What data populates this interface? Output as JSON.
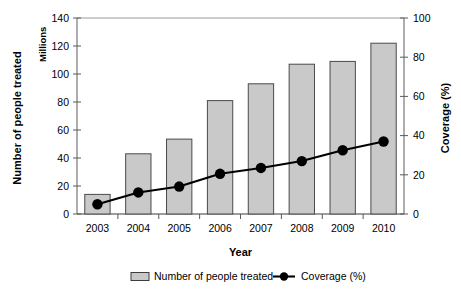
{
  "chart_data": {
    "type": "bar",
    "title": "",
    "categories": [
      "2003",
      "2004",
      "2005",
      "2006",
      "2007",
      "2008",
      "2009",
      "2010"
    ],
    "xlabel": "Year",
    "ylabel": "Number of people treated",
    "y_unit_label": "Millions",
    "ylabel_right": "Coverage (%)",
    "ylim": [
      0,
      140
    ],
    "ylim_right": [
      0,
      100
    ],
    "yticks": [
      0,
      20,
      40,
      60,
      80,
      100,
      120,
      140
    ],
    "yticks_right": [
      0,
      20,
      40,
      60,
      80,
      100
    ],
    "grid": false,
    "legend_position": "bottom",
    "series": [
      {
        "name": "Number of people treated",
        "type": "bar",
        "axis": "left",
        "values": [
          14,
          43,
          53.5,
          81,
          93,
          107,
          109,
          122
        ]
      },
      {
        "name": "Coverage (%)",
        "type": "line",
        "axis": "right",
        "marker": "circle",
        "values": [
          5,
          11,
          14,
          20.5,
          23.5,
          27,
          32.5,
          37
        ]
      }
    ]
  },
  "legend": {
    "entries": [
      {
        "label": "Number of people treated",
        "marker": "bar-swatch",
        "color": "#c9c9c9"
      },
      {
        "label": "Coverage (%)",
        "marker": "line-circle",
        "color": "#000000"
      }
    ]
  },
  "axes": {
    "left_title": "Number of people treated",
    "left_unit": "Millions",
    "right_title": "Coverage (%)",
    "bottom_title": "Year"
  }
}
